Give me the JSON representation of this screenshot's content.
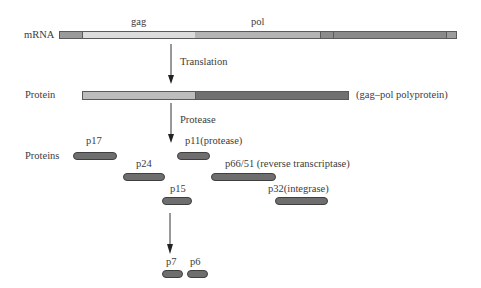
{
  "diagram": {
    "rows": {
      "mrna_label": "mRNA",
      "protein_label": "Protein",
      "proteins_label": "Proteins"
    },
    "gene_labels": {
      "gag": "gag",
      "pol": "pol"
    },
    "steps": {
      "translation": "Translation",
      "protease": "Protease"
    },
    "polyprotein_note": "(gag–pol polyprotein)",
    "mrna_segments": [
      {
        "name": "5-prime-region",
        "x0": 59,
        "x1": 82,
        "color": "#9a9a9a"
      },
      {
        "name": "gag-region",
        "x0": 82,
        "x1": 195,
        "color": "#dcdcdc"
      },
      {
        "name": "pol-region-a",
        "x0": 195,
        "x1": 320,
        "color": "#b4b4b4"
      },
      {
        "name": "pol-region-b",
        "x0": 320,
        "x1": 333,
        "color": "#8c8c8c"
      },
      {
        "name": "pol-region-c",
        "x0": 333,
        "x1": 446,
        "color": "#8a8a8a"
      },
      {
        "name": "3-prime-region",
        "x0": 446,
        "x1": 457,
        "color": "#9c9c9c"
      }
    ],
    "protein_segments": [
      {
        "name": "gag-part",
        "x0": 82,
        "x1": 195,
        "color": "#bdbdbd"
      },
      {
        "name": "pol-part",
        "x0": 195,
        "x1": 349,
        "color": "#707070"
      }
    ],
    "cleavage_products": [
      {
        "id": "p17",
        "label": "p17",
        "x0": 73,
        "x1": 117,
        "y": 156,
        "label_x": 86,
        "label_y": 135
      },
      {
        "id": "p11",
        "label": "p11(protease)",
        "x0": 177,
        "x1": 210,
        "y": 156,
        "label_x": 185,
        "label_y": 135
      },
      {
        "id": "p24",
        "label": "p24",
        "x0": 123,
        "x1": 165,
        "y": 177,
        "label_x": 136,
        "label_y": 158
      },
      {
        "id": "p66-51",
        "label": "p66/51 (reverse transcriptase)",
        "x0": 211,
        "x1": 276,
        "y": 177,
        "label_x": 225,
        "label_y": 158
      },
      {
        "id": "p15",
        "label": "p15",
        "x0": 162,
        "x1": 192,
        "y": 201,
        "label_x": 170,
        "label_y": 183
      },
      {
        "id": "p32",
        "label": "p32(integrase)",
        "x0": 275,
        "x1": 328,
        "y": 201,
        "label_x": 268,
        "label_y": 183
      },
      {
        "id": "p7",
        "label": "p7",
        "x0": 162,
        "x1": 182,
        "y": 274,
        "label_x": 166,
        "label_y": 256
      },
      {
        "id": "p6",
        "label": "p6",
        "x0": 187,
        "x1": 207,
        "y": 274,
        "label_x": 190,
        "label_y": 256
      }
    ],
    "colors": {
      "text": "#3c3c3c",
      "outline": "#4a4a4a",
      "pill_fill": "#6e6e6e",
      "arrow": "#222222"
    }
  }
}
